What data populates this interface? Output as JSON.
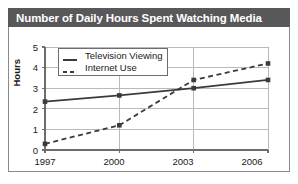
{
  "title": "Number of Daily Hours Spent Watching Media",
  "colors": {
    "title_bar": "#58585a",
    "title_text": "#ffffff",
    "panel_background": "#ffffff",
    "panel_border": "#8a8a8a",
    "grid": "#b9b9b9",
    "axis": "#6d6d6d",
    "series_television": "#3b3b3b",
    "series_internet": "#3b3b3b",
    "text": "#1a1a1a"
  },
  "chart_data": {
    "type": "line",
    "title": "Number of Daily Hours Spent Watching Media",
    "xlabel": "",
    "ylabel": "Hours",
    "categories": [
      "1997",
      "2000",
      "2003",
      "2006"
    ],
    "x": [
      1997,
      2000,
      2003,
      2006
    ],
    "xlim": [
      1997,
      2006
    ],
    "ylim": [
      0,
      5
    ],
    "yticks": [
      "0",
      "1",
      "2",
      "3",
      "4",
      "5"
    ],
    "ytick_values": [
      0,
      1,
      2,
      3,
      4,
      5
    ],
    "xticks": [
      "1997",
      "2000",
      "2003",
      "2006"
    ],
    "grid": true,
    "legend_position": "upper-left-inside",
    "series": [
      {
        "name": "Television Viewing",
        "style": "solid",
        "marker": "square",
        "values": [
          2.35,
          2.65,
          3.0,
          3.4
        ]
      },
      {
        "name": "Internet Use",
        "style": "dashed",
        "marker": "square",
        "values": [
          0.3,
          1.2,
          3.4,
          4.2
        ]
      }
    ]
  }
}
